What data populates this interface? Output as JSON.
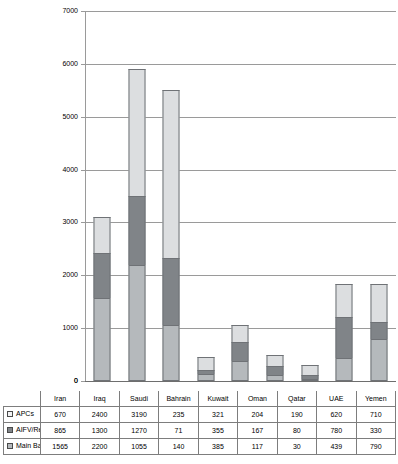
{
  "chart_data": {
    "type": "bar",
    "subtype": "stacked-column",
    "title": "",
    "xlabel": "",
    "ylabel": "",
    "ylim": [
      0,
      7000
    ],
    "ytick_step": 1000,
    "yticks": [
      "0",
      "1000",
      "2000",
      "3000",
      "4000",
      "5000",
      "6000",
      "7000"
    ],
    "grid": true,
    "legend_position": "table-row-labels",
    "categories": [
      "Iran",
      "Iraq",
      "Saudi",
      "Bahrain",
      "Kuwait",
      "Oman",
      "Qatar",
      "UAE",
      "Yemen"
    ],
    "series": [
      {
        "name": "APCs",
        "color": "#dcdee0",
        "stack_order": 3,
        "values": [
          670,
          2400,
          3190,
          235,
          321,
          204,
          190,
          620,
          710
        ]
      },
      {
        "name": "AIFV/Recce/Lt. Tanks",
        "color": "#808488",
        "stack_order": 2,
        "values": [
          865,
          1300,
          1270,
          71,
          355,
          167,
          80,
          780,
          330
        ]
      },
      {
        "name": "Main Battle Tanks",
        "color": "#b5b9bc",
        "stack_order": 1,
        "values": [
          1565,
          2200,
          1055,
          140,
          385,
          117,
          30,
          439,
          790
        ]
      }
    ],
    "totals": [
      3100,
      5900,
      5515,
      446,
      1061,
      488,
      300,
      1839,
      1830
    ]
  },
  "table": {
    "corner_label": "",
    "column_headers": [
      "Iran",
      "Iraq",
      "Saudi",
      "Bahrain",
      "Kuwait",
      "Oman",
      "Qatar",
      "UAE",
      "Yemen"
    ],
    "rows": [
      {
        "label": "APCs",
        "swatch_color": "#f2f3f4",
        "values": [
          "670",
          "2400",
          "3190",
          "235",
          "321",
          "204",
          "190",
          "620",
          "710"
        ]
      },
      {
        "label": "AIFV/Recce/Lt. Tanks",
        "swatch_color": "#808488",
        "values": [
          "865",
          "1300",
          "1270",
          "71",
          "355",
          "167",
          "80",
          "780",
          "330"
        ]
      },
      {
        "label": "Main Battle Tanks",
        "swatch_color": "#b5b9bc",
        "values": [
          "1565",
          "2200",
          "1055",
          "140",
          "385",
          "117",
          "30",
          "439",
          "790"
        ]
      }
    ]
  },
  "axis": {
    "zero_label": "0"
  }
}
